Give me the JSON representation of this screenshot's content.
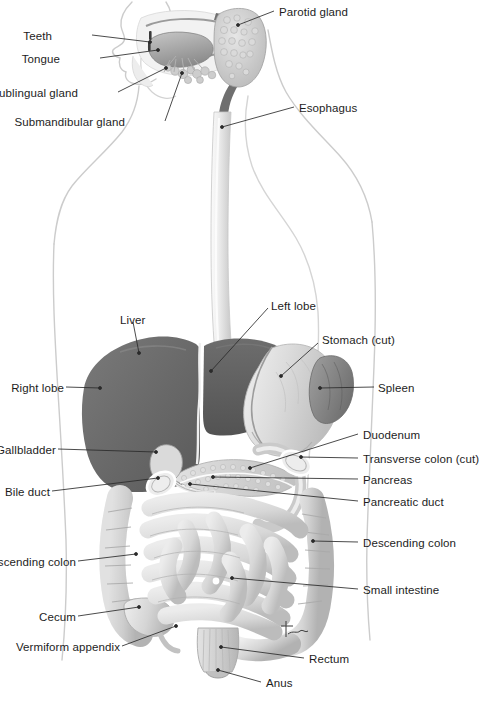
{
  "figure": {
    "width": 477,
    "height": 708,
    "background": "#ffffff",
    "signature": "tuc"
  },
  "palette": {
    "body_outline": "#c9c9c9",
    "leader_line": "#2a2a2a",
    "label_text": "#1d1d1d",
    "liver_right_lobe": "#686868",
    "liver_left_lobe": "#5d5d5d",
    "stomach": "#d8d8d8",
    "spleen": "#8a8a8a",
    "esophagus": "#ececec",
    "intestine": "#dcdcdc",
    "intestine_shade": "#b4b4b4",
    "pancreas": "#cfcfcf",
    "parotid": "#cfcfcf",
    "tongue": "#9b9b9b",
    "pharynx": "#7b7b7b",
    "rectum": "#cccccc"
  },
  "labels": [
    {
      "id": "teeth",
      "text": "Teeth",
      "side": "left",
      "x": 57,
      "y": 30,
      "anchor_x": 150,
      "anchor_y": 42
    },
    {
      "id": "tongue",
      "text": "Tongue",
      "side": "left",
      "x": 57,
      "y": 53,
      "anchor_x": 158,
      "anchor_y": 50
    },
    {
      "id": "sublingual-gland",
      "text": "Sublingual gland",
      "side": "left",
      "x": 20,
      "y": 87,
      "anchor_x": 165,
      "anchor_y": 68
    },
    {
      "id": "submandibular-gland",
      "text": "Submandibular gland",
      "side": "left",
      "x": 50,
      "y": 116,
      "anchor_x": 180,
      "anchor_y": 72
    },
    {
      "id": "parotid-gland",
      "text": "Parotid gland",
      "side": "right",
      "x": 279,
      "y": 6,
      "anchor_x": 238,
      "anchor_y": 22
    },
    {
      "id": "esophagus",
      "text": "Esophagus",
      "side": "right",
      "x": 299,
      "y": 102,
      "anchor_x": 222,
      "anchor_y": 127
    },
    {
      "id": "liver",
      "text": "Liver",
      "side": "right",
      "x": 120,
      "y": 314,
      "anchor_x": 139,
      "anchor_y": 353
    },
    {
      "id": "left-lobe",
      "text": "Left lobe",
      "side": "right",
      "x": 271,
      "y": 300,
      "anchor_x": 211,
      "anchor_y": 371
    },
    {
      "id": "stomach-cut",
      "text": "Stomach (cut)",
      "side": "right",
      "x": 322,
      "y": 334,
      "anchor_x": 281,
      "anchor_y": 376
    },
    {
      "id": "right-lobe",
      "text": "Right lobe",
      "side": "left",
      "x": 8,
      "y": 382,
      "anchor_x": 100,
      "anchor_y": 388
    },
    {
      "id": "spleen",
      "text": "Spleen",
      "side": "right",
      "x": 378,
      "y": 382,
      "anchor_x": 320,
      "anchor_y": 388
    },
    {
      "id": "gallbladder",
      "text": "Gallbladder",
      "side": "left",
      "x": -16,
      "y": 444,
      "anchor_x": 156,
      "anchor_y": 452
    },
    {
      "id": "bile-duct",
      "text": "Bile duct",
      "side": "left",
      "x": 5,
      "y": 486,
      "anchor_x": 158,
      "anchor_y": 478
    },
    {
      "id": "duodenum",
      "text": "Duodenum",
      "side": "right",
      "x": 363,
      "y": 429,
      "anchor_x": 250,
      "anchor_y": 468
    },
    {
      "id": "transverse-colon-cut",
      "text": "Transverse colon (cut)",
      "side": "right",
      "x": 363,
      "y": 453,
      "anchor_x": 301,
      "anchor_y": 457
    },
    {
      "id": "pancreas",
      "text": "Pancreas",
      "side": "right",
      "x": 363,
      "y": 474,
      "anchor_x": 213,
      "anchor_y": 477
    },
    {
      "id": "pancreatic-duct",
      "text": "Pancreatic duct",
      "side": "right",
      "x": 363,
      "y": 496,
      "anchor_x": 190,
      "anchor_y": 483
    },
    {
      "id": "descending-colon",
      "text": "Descending colon",
      "side": "right",
      "x": 363,
      "y": 537,
      "anchor_x": 313,
      "anchor_y": 541
    },
    {
      "id": "ascending-colon",
      "text": "Ascending colon",
      "side": "left",
      "x": -12,
      "y": 556,
      "anchor_x": 136,
      "anchor_y": 554
    },
    {
      "id": "small-intestine",
      "text": "Small intestine",
      "side": "right",
      "x": 363,
      "y": 584,
      "anchor_x": 232,
      "anchor_y": 578
    },
    {
      "id": "cecum",
      "text": "Cecum",
      "side": "left",
      "x": 32,
      "y": 611,
      "anchor_x": 139,
      "anchor_y": 607
    },
    {
      "id": "vermiform-appendix",
      "text": "Vermiform appendix",
      "side": "left",
      "x": 18,
      "y": 641,
      "anchor_x": 165,
      "anchor_y": 625
    },
    {
      "id": "rectum",
      "text": "Rectum",
      "side": "right",
      "x": 309,
      "y": 653,
      "anchor_x": 221,
      "anchor_y": 647
    },
    {
      "id": "anus",
      "text": "Anus",
      "side": "right",
      "x": 266,
      "y": 677,
      "anchor_x": 218,
      "anchor_y": 670
    }
  ],
  "organs": [
    {
      "id": "parotid-gland",
      "name": "Parotid gland"
    },
    {
      "id": "teeth",
      "name": "Teeth"
    },
    {
      "id": "tongue",
      "name": "Tongue"
    },
    {
      "id": "sublingual-gland",
      "name": "Sublingual gland"
    },
    {
      "id": "submandibular-gland",
      "name": "Submandibular gland"
    },
    {
      "id": "esophagus",
      "name": "Esophagus"
    },
    {
      "id": "liver",
      "name": "Liver"
    },
    {
      "id": "stomach",
      "name": "Stomach (cut)"
    },
    {
      "id": "spleen",
      "name": "Spleen"
    },
    {
      "id": "gallbladder",
      "name": "Gallbladder"
    },
    {
      "id": "bile-duct",
      "name": "Bile duct"
    },
    {
      "id": "duodenum",
      "name": "Duodenum"
    },
    {
      "id": "pancreas",
      "name": "Pancreas"
    },
    {
      "id": "transverse-colon",
      "name": "Transverse colon (cut)"
    },
    {
      "id": "ascending-colon",
      "name": "Ascending colon"
    },
    {
      "id": "descending-colon",
      "name": "Descending colon"
    },
    {
      "id": "small-intestine",
      "name": "Small intestine"
    },
    {
      "id": "cecum",
      "name": "Cecum"
    },
    {
      "id": "vermiform-appendix",
      "name": "Vermiform appendix"
    },
    {
      "id": "rectum",
      "name": "Rectum"
    },
    {
      "id": "anus",
      "name": "Anus"
    }
  ]
}
